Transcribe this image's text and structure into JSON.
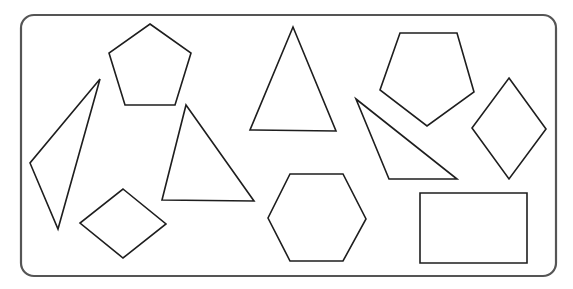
{
  "diagram": {
    "title": "",
    "frame": {
      "x": 21,
      "y": 15,
      "width": 535,
      "height": 261,
      "radius": 13,
      "stroke": "#555555"
    },
    "stroke_color": "#1e1e1e",
    "shapes": [
      {
        "name": "pentagon-left",
        "type": "pentagon",
        "points": "150,24 191,53 175,105 125,105 109,53"
      },
      {
        "name": "thin-triangle",
        "type": "triangle",
        "points": "100,79 58,229 30,163"
      },
      {
        "name": "rhombus-bottom-left",
        "type": "rhombus",
        "points": "123,189 166,224 123,258 80,223"
      },
      {
        "name": "triangle-middle-left",
        "type": "triangle",
        "points": "186,105 254,201 162,200"
      },
      {
        "name": "triangle-center",
        "type": "triangle",
        "points": "293,27 336,131 250,130"
      },
      {
        "name": "hexagon",
        "type": "hexagon",
        "points": "290,174 343,174 366,219 343,261 290,261 268,218"
      },
      {
        "name": "pentagon-right",
        "type": "pentagon",
        "points": "400,33 457,33 474,92 427,126 380,90"
      },
      {
        "name": "right-triangle",
        "type": "triangle",
        "points": "356,99 457,179 389,179"
      },
      {
        "name": "rhombus-right",
        "type": "rhombus",
        "points": "509,78 546,129 509,179 472,128"
      },
      {
        "name": "rectangle",
        "type": "rectangle",
        "points": "420,193 527,193 527,263 420,263"
      }
    ]
  }
}
